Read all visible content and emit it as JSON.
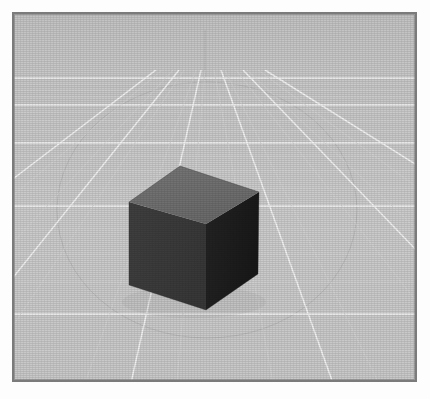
{
  "app": {
    "title": "3D Viewport Render",
    "kind": "3d-viewport-still"
  },
  "frame": {
    "border_color": "#7b7b7b",
    "page_background": "#fdfdfd",
    "x": 12,
    "y": 12,
    "width": 405,
    "height": 370
  },
  "scene": {
    "background_sky_color": "#c5c5c5",
    "background_floor_color": "#c9c9c9",
    "horizon_y": 63,
    "grid": {
      "major_line_color": "#f2f2f2",
      "minor_line_color": "#d2d2d2",
      "vanishing_point_x": 193,
      "vanishing_point_y": 55,
      "major_rows": 8,
      "major_cols": 9,
      "minor_subdivisions": 3
    },
    "z_axis_line": {
      "color": "#b0b0b0",
      "x": 191,
      "top_y": 16,
      "bottom_y": 66
    },
    "ground_circle": {
      "color": "#b6b6b6",
      "center_x": 193,
      "center_y": 196,
      "radius_x": 150,
      "radius_y": 128,
      "label": "ground-plane-circle"
    },
    "objects": [
      {
        "name": "cube",
        "type": "cube",
        "top_face_color": "#6e6e6e",
        "left_face_color": "#3c3c3c",
        "right_face_color": "#1e1e1e",
        "vertices": {
          "top_back": [
            166,
            152
          ],
          "top_left": [
            115,
            188
          ],
          "top_front": [
            192,
            210
          ],
          "top_right": [
            245,
            178
          ],
          "bottom_left": [
            115,
            271
          ],
          "bottom_front": [
            192,
            296
          ],
          "bottom_right": [
            244,
            260
          ]
        }
      }
    ]
  }
}
